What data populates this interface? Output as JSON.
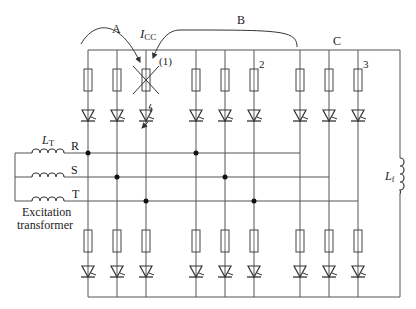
{
  "labels": {
    "group_a": "A",
    "group_b": "B",
    "group_c": "C",
    "icc_main": "I",
    "icc_sub": "CC",
    "fault_marker": "(1)",
    "branch_2": "2",
    "branch_3": "3",
    "lt_main": "L",
    "lt_sub": "T",
    "lf_main": "L",
    "lf_sub": "f",
    "phase_r": "R",
    "phase_s": "S",
    "phase_t": "T",
    "transformer_line1": "Excitation",
    "transformer_line2": "transformer"
  },
  "colors": {
    "line": "#555555",
    "text": "#222222",
    "background": "#ffffff"
  },
  "bridges": [
    {
      "name": "A",
      "columns": [
        88,
        117,
        146
      ]
    },
    {
      "name": "B",
      "columns": [
        196,
        225,
        254
      ]
    },
    {
      "name": "C",
      "columns": [
        300,
        329,
        358
      ]
    }
  ]
}
